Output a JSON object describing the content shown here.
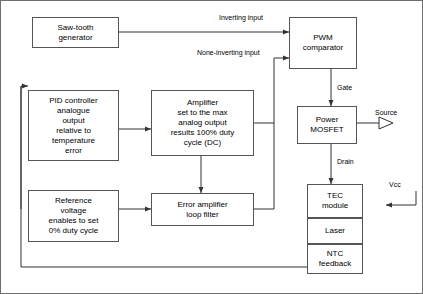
{
  "diagram": {
    "boxes": [
      {
        "id": "sawtooth",
        "label": "Saw-tooth\ngenerator"
      },
      {
        "id": "pwm",
        "label": "PWM\ncomparator"
      },
      {
        "id": "pid",
        "label": "PID controller\nanalogue\noutput\nrelative to\ntemperature\nerror"
      },
      {
        "id": "amplifier",
        "label": "Amplifier\nset to the max\nanalog output\nresults 100% duty\ncycle (DC)"
      },
      {
        "id": "mosfet",
        "label": "Power\nMOSFET"
      },
      {
        "id": "reference",
        "label": "Reference\nvoltage\nenables to set\n0% duty cycle"
      },
      {
        "id": "errloop",
        "label": "Error amplifier\nloop filter"
      },
      {
        "id": "tec",
        "label": "TEC\nmodule"
      },
      {
        "id": "laser",
        "label": "Laser"
      },
      {
        "id": "ntc",
        "label": "NTC\nfeedback"
      }
    ],
    "labels": [
      {
        "id": "inverting",
        "text": "Inverting input"
      },
      {
        "id": "none-inverting",
        "text": "None-inverting input"
      },
      {
        "id": "gate",
        "text": "Gate"
      },
      {
        "id": "source",
        "text": "Source"
      },
      {
        "id": "drain",
        "text": "Drain"
      },
      {
        "id": "vcc",
        "text": "Vcc"
      }
    ],
    "colors": {
      "line": "#333333",
      "border": "#555555",
      "frame": "#6f6f6f",
      "background": "#ffffff",
      "text": "#000000"
    }
  }
}
